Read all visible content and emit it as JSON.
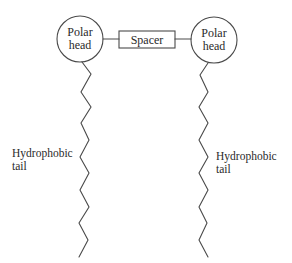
{
  "diagram": {
    "left_head": {
      "line1": "Polar",
      "line2": "head",
      "cx": 80,
      "cy": 39,
      "r": 23
    },
    "right_head": {
      "line1": "Polar",
      "line2": "head",
      "cx": 214,
      "cy": 40,
      "r": 23
    },
    "spacer": {
      "label": "Spacer",
      "x": 119,
      "y": 31,
      "width": 56,
      "height": 17
    },
    "left_tail": {
      "label_line1": "Hydrophobic",
      "label_line2": "tail",
      "points": "82,62 91,74 81,92 91,107 81,123 89,140 80,157 89,173 80,190 89,207 79,223 88,240 79,257"
    },
    "right_tail": {
      "label_line1": "Hydrophobic",
      "label_line2": "tail",
      "points": "208,63 200,75 208,92 199,107 208,123 199,140 208,157 199,173 208,190 199,207 207,223 199,240 208,257"
    },
    "colors": {
      "stroke": "#4a4a4a",
      "text": "#2a2a2a",
      "background": "#ffffff"
    }
  }
}
